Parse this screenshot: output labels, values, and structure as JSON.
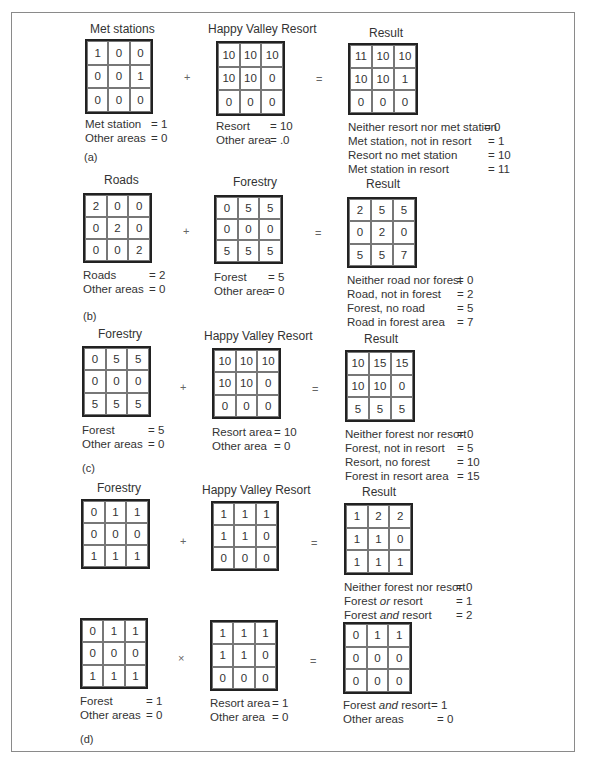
{
  "panels": [
    {
      "tag": "(a)",
      "operator": "+",
      "equals": "=",
      "left": {
        "title": "Met stations",
        "cells": [
          "1",
          "0",
          "0",
          "0",
          "0",
          "1",
          "0",
          "0",
          "0"
        ],
        "legend": [
          {
            "k": "Met station",
            "v": "= 1"
          },
          {
            "k": "Other areas",
            "v": "= 0"
          }
        ]
      },
      "middle": {
        "title": "Happy Valley Resort",
        "cells": [
          "10",
          "10",
          "10",
          "10",
          "10",
          "0",
          "0",
          "0",
          "0"
        ],
        "legend": [
          {
            "k": "Resort",
            "v": "= 10"
          },
          {
            "k": "Other area",
            "v": "= .0"
          }
        ]
      },
      "result": {
        "title": "Result",
        "cells": [
          "11",
          "10",
          "10",
          "10",
          "10",
          "1",
          "0",
          "0",
          "0"
        ],
        "legend": [
          {
            "k": "Neither resort nor met station",
            "v": "= 0"
          },
          {
            "k": "Met station, not in resort",
            "v": "= 1"
          },
          {
            "k": "Resort no met station",
            "v": "= 10"
          },
          {
            "k": "Met station in resort",
            "v": "= 11"
          }
        ]
      }
    },
    {
      "tag": "(b)",
      "operator": "+",
      "equals": "=",
      "left": {
        "title": "Roads",
        "cells": [
          "2",
          "0",
          "0",
          "0",
          "2",
          "0",
          "0",
          "0",
          "2"
        ],
        "legend": [
          {
            "k": "Roads",
            "v": "= 2"
          },
          {
            "k": "Other areas",
            "v": "= 0"
          }
        ]
      },
      "middle": {
        "title": "Forestry",
        "cells": [
          "0",
          "5",
          "5",
          "0",
          "0",
          "0",
          "5",
          "5",
          "5"
        ],
        "legend": [
          {
            "k": "Forest",
            "v": "= 5"
          },
          {
            "k": "Other area",
            "v": "= 0"
          }
        ]
      },
      "result": {
        "title": "Result",
        "cells": [
          "2",
          "5",
          "5",
          "0",
          "2",
          "0",
          "5",
          "5",
          "7"
        ],
        "legend": [
          {
            "k": "Neither road nor forest",
            "v": "= 0"
          },
          {
            "k": "Road, not in forest",
            "v": "= 2"
          },
          {
            "k": "Forest, no road",
            "v": "= 5"
          },
          {
            "k": "Road in forest area",
            "v": "= 7"
          }
        ]
      }
    },
    {
      "tag": "(c)",
      "operator": "+",
      "equals": "=",
      "left": {
        "title": "Forestry",
        "cells": [
          "0",
          "5",
          "5",
          "0",
          "0",
          "0",
          "5",
          "5",
          "5"
        ],
        "legend": [
          {
            "k": "Forest",
            "v": "= 5"
          },
          {
            "k": "Other areas",
            "v": "= 0"
          }
        ]
      },
      "middle": {
        "title": "Happy Valley Resort",
        "cells": [
          "10",
          "10",
          "10",
          "10",
          "10",
          "0",
          "0",
          "0",
          "0"
        ],
        "legend": [
          {
            "k": "Resort area",
            "v": "= 10"
          },
          {
            "k": "Other area",
            "v": "= 0"
          }
        ]
      },
      "result": {
        "title": "Result",
        "cells": [
          "10",
          "15",
          "15",
          "10",
          "10",
          "0",
          "5",
          "5",
          "5"
        ],
        "legend": [
          {
            "k": "Neither forest nor resort",
            "v": "= 0"
          },
          {
            "k": "Forest, not in resort",
            "v": "= 5"
          },
          {
            "k": "Resort, no forest",
            "v": "= 10"
          },
          {
            "k": "Forest in resort area",
            "v": "= 15"
          }
        ]
      }
    },
    {
      "tag": "",
      "operator": "+",
      "equals": "=",
      "left": {
        "title": "Forestry",
        "cells": [
          "0",
          "1",
          "1",
          "0",
          "0",
          "0",
          "1",
          "1",
          "1"
        ],
        "legend": []
      },
      "middle": {
        "title": "Happy Valley Resort",
        "cells": [
          "1",
          "1",
          "1",
          "1",
          "1",
          "0",
          "0",
          "0",
          "0"
        ],
        "legend": []
      },
      "result": {
        "title": "Result",
        "cells": [
          "1",
          "2",
          "2",
          "1",
          "1",
          "0",
          "1",
          "1",
          "1"
        ],
        "legend": [
          {
            "k": "Neither forest nor resort",
            "v": "= 0"
          },
          {
            "k": "Forest ",
            "ki": "or",
            "k2": " resort",
            "v": "= 1"
          },
          {
            "k": "Forest ",
            "ki": "and",
            "k2": " resort",
            "v": "= 2"
          }
        ]
      }
    },
    {
      "tag": "(d)",
      "operator": "×",
      "equals": "=",
      "left": {
        "title": "",
        "cells": [
          "0",
          "1",
          "1",
          "0",
          "0",
          "0",
          "1",
          "1",
          "1"
        ],
        "legend": [
          {
            "k": "Forest",
            "v": "= 1"
          },
          {
            "k": "Other areas",
            "v": "= 0"
          }
        ]
      },
      "middle": {
        "title": "",
        "cells": [
          "1",
          "1",
          "1",
          "1",
          "1",
          "0",
          "0",
          "0",
          "0"
        ],
        "legend": [
          {
            "k": "Resort area",
            "v": "= 1"
          },
          {
            "k": "Other area",
            "v": "= 0"
          }
        ]
      },
      "result": {
        "title": "",
        "cells": [
          "0",
          "1",
          "1",
          "0",
          "0",
          "0",
          "0",
          "0",
          "0"
        ],
        "legend": [
          {
            "k": "Forest ",
            "ki": "and",
            "k2": " resort",
            "v": "= 1"
          },
          {
            "k": "Other areas",
            "v": "= 0"
          }
        ]
      }
    }
  ]
}
